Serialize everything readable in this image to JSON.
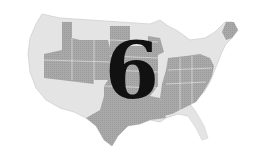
{
  "map": {
    "subject": "Contiguous United States",
    "label_number": "6",
    "colors": {
      "background": "#ffffff",
      "light_region": "#e4e4e4",
      "dark_region": "#a9a9a9",
      "border": "#cfcfcf",
      "number": "#111111"
    },
    "shading": {
      "dark_states_note": "Interior West, Plains, South, Southeast",
      "light_states_note": "Pacific coast, Southwest, Northern tier, Great Lakes, Northeast, Florida"
    }
  }
}
